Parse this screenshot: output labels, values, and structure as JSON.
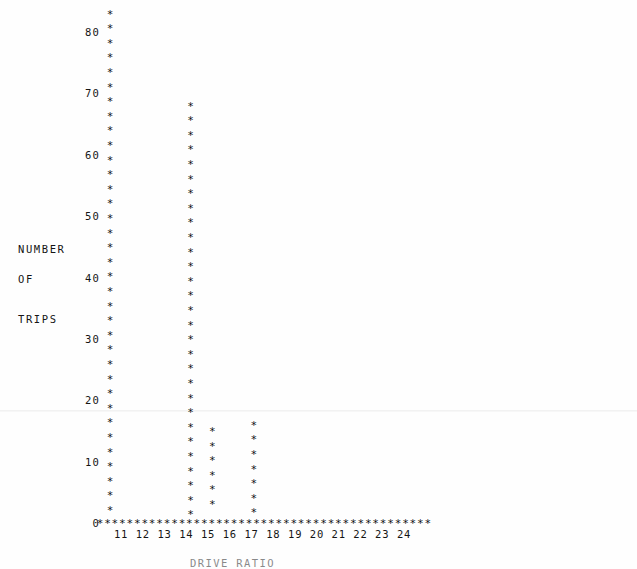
{
  "chart_data": {
    "type": "bar",
    "title": "",
    "subtitle": "",
    "xlabel": "DRIVE RATIO",
    "ylabel": "NUMBER OF TRIPS",
    "ylabel_lines": [
      "NUMBER",
      "OF",
      "TRIPS"
    ],
    "glyph": "*",
    "grid": false,
    "legend": null,
    "xlim": [
      10.0,
      25.4
    ],
    "ylim": [
      0,
      83
    ],
    "yticks": [
      0,
      10,
      20,
      30,
      40,
      50,
      60,
      70,
      80
    ],
    "ytick_labels": [
      "0",
      "10",
      "20",
      "30",
      "40",
      "50",
      "60",
      "70",
      "80"
    ],
    "xticks": [
      11,
      12,
      13,
      14,
      15,
      16,
      17,
      18,
      19,
      20,
      21,
      22,
      23,
      24
    ],
    "xtick_labels": [
      "11",
      "12",
      "13",
      "14",
      "15",
      "16",
      "17",
      "18",
      "19",
      "20",
      "21",
      "22",
      "23",
      "24"
    ],
    "x": [
      10.5,
      14.2,
      15.2,
      17.1
    ],
    "values": [
      83,
      68,
      15,
      16
    ],
    "categories": [
      "10.5",
      "14.2",
      "15.2",
      "17.1"
    ],
    "axis_baseline_value": 0
  },
  "caption": {
    "text": "DRIVE RATIO"
  }
}
